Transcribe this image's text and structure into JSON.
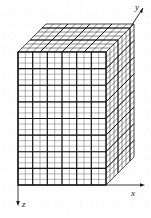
{
  "figure": {
    "type": "oblique-projection-diagram",
    "background_color": "#fefefe",
    "line_color": "#1a1a1a",
    "face_fill_front": "#ffffff",
    "face_fill_top": "#ffffff",
    "face_fill_side": "#ffffff"
  },
  "axes": [
    {
      "id": "x",
      "label": "x",
      "direction": "right",
      "label_x": 134,
      "label_y": 196
    },
    {
      "id": "y",
      "label": "y",
      "direction": "up-right",
      "label_x": 137,
      "label_y": 11
    },
    {
      "id": "z",
      "label": "z",
      "direction": "down",
      "label_x": 23,
      "label_y": 204
    }
  ],
  "box": {
    "front_face": {
      "left": 18,
      "right": 106,
      "top": 52,
      "bottom": 185,
      "columns": 12,
      "rows": 24,
      "major_every_col": 2,
      "major_every_row": 3
    },
    "depth": {
      "dx": 28,
      "dy": -28,
      "layers": 7
    },
    "unit_cells_label": "unit cubes"
  },
  "geometry_notes": {
    "projection": "oblique (cabinet-like) 45 degrees",
    "front_cell_width": 7.33,
    "front_cell_height": 5.54,
    "depth_step_x": 4.0,
    "depth_step_y": -4.0
  }
}
